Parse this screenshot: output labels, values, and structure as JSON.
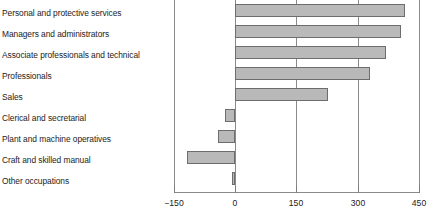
{
  "chart_data": {
    "type": "bar",
    "orientation": "horizontal",
    "title": "",
    "subtitle": "",
    "xlabel": "",
    "ylabel": "",
    "xlim": [
      -150,
      450
    ],
    "xticks": [
      -150,
      0,
      150,
      300,
      450
    ],
    "xtick_labels": [
      "−150",
      "0",
      "150",
      "300",
      "450"
    ],
    "grid": true,
    "grid_axis": "x",
    "legend": false,
    "legend_position": "none",
    "bar_fill_color": "#b9b9b9",
    "bar_border_color": "#6d6d6d",
    "axis_color": "#8a8a8a",
    "categories": [
      "Personal and protective services",
      "Managers and administrators",
      "Associate professionals and technical",
      "Professionals",
      "Sales",
      "Clerical and secretarial",
      "Plant and machine operatives",
      "Craft and skilled manual",
      "Other occupations"
    ],
    "values": [
      415,
      405,
      370,
      330,
      226,
      -25,
      -42,
      -118,
      -8
    ]
  }
}
